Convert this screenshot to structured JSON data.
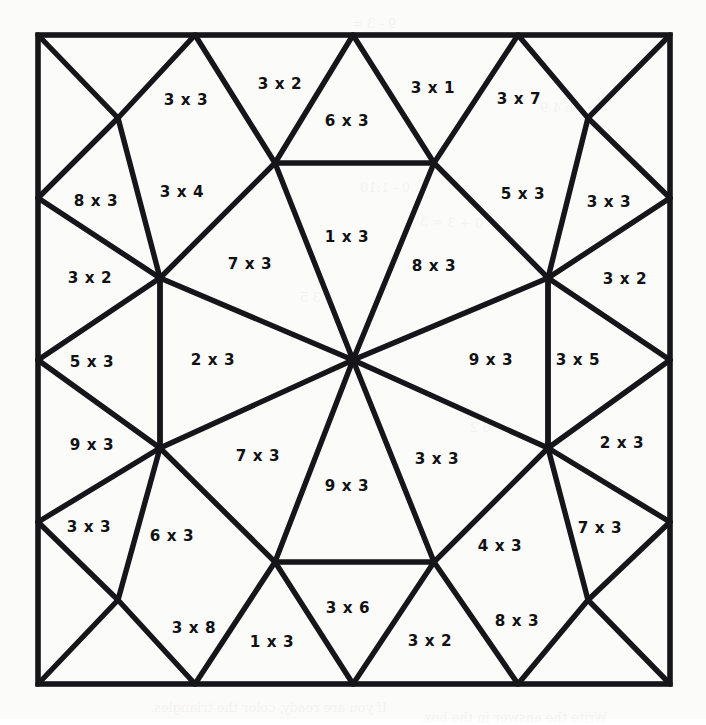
{
  "page": {
    "type": "math-coloring-worksheet",
    "background_color": "#fbfbfa",
    "line_color": "#16161a",
    "text_color": "#111114",
    "width": 706,
    "height": 719
  },
  "frame": {
    "left": 38,
    "top": 35,
    "right": 670,
    "bottom": 684
  },
  "geometry": {
    "outer_corners": [
      [
        38,
        35
      ],
      [
        670,
        35
      ],
      [
        670,
        684
      ],
      [
        38,
        684
      ]
    ],
    "edge_points": {
      "top": [
        [
          195,
          35
        ],
        [
          353,
          35
        ],
        [
          518,
          35
        ]
      ],
      "bottom": [
        [
          195,
          684
        ],
        [
          353,
          684
        ],
        [
          518,
          684
        ]
      ],
      "left": [
        [
          38,
          198
        ],
        [
          38,
          360
        ],
        [
          38,
          522
        ]
      ],
      "right": [
        [
          670,
          198
        ],
        [
          670,
          360
        ],
        [
          670,
          522
        ]
      ]
    },
    "corner_vertices": [
      [
        118,
        118
      ],
      [
        588,
        118
      ],
      [
        588,
        600
      ],
      [
        118,
        600
      ]
    ],
    "ring_vertices": [
      [
        275,
        163
      ],
      [
        434,
        163
      ],
      [
        548,
        278
      ],
      [
        548,
        448
      ],
      [
        434,
        562
      ],
      [
        275,
        562
      ],
      [
        160,
        448
      ],
      [
        160,
        278
      ]
    ],
    "center": [
      353,
      360
    ],
    "segments": [
      [
        [
          38,
          35
        ],
        [
          118,
          118
        ]
      ],
      [
        [
          118,
          118
        ],
        [
          195,
          35
        ]
      ],
      [
        [
          195,
          35
        ],
        [
          275,
          163
        ]
      ],
      [
        [
          275,
          163
        ],
        [
          353,
          35
        ]
      ],
      [
        [
          353,
          35
        ],
        [
          434,
          163
        ]
      ],
      [
        [
          434,
          163
        ],
        [
          518,
          35
        ]
      ],
      [
        [
          518,
          35
        ],
        [
          588,
          118
        ]
      ],
      [
        [
          588,
          118
        ],
        [
          670,
          35
        ]
      ],
      [
        [
          670,
          198
        ],
        [
          588,
          118
        ]
      ],
      [
        [
          588,
          118
        ],
        [
          548,
          278
        ]
      ],
      [
        [
          548,
          278
        ],
        [
          670,
          198
        ]
      ],
      [
        [
          670,
          360
        ],
        [
          548,
          278
        ]
      ],
      [
        [
          548,
          278
        ],
        [
          548,
          448
        ]
      ],
      [
        [
          548,
          448
        ],
        [
          670,
          360
        ]
      ],
      [
        [
          670,
          522
        ],
        [
          548,
          448
        ]
      ],
      [
        [
          548,
          448
        ],
        [
          588,
          600
        ]
      ],
      [
        [
          588,
          600
        ],
        [
          670,
          522
        ]
      ],
      [
        [
          670,
          684
        ],
        [
          588,
          600
        ]
      ],
      [
        [
          588,
          600
        ],
        [
          518,
          684
        ]
      ],
      [
        [
          518,
          684
        ],
        [
          434,
          562
        ]
      ],
      [
        [
          434,
          562
        ],
        [
          353,
          684
        ]
      ],
      [
        [
          353,
          684
        ],
        [
          275,
          562
        ]
      ],
      [
        [
          275,
          562
        ],
        [
          195,
          684
        ]
      ],
      [
        [
          195,
          684
        ],
        [
          118,
          600
        ]
      ],
      [
        [
          118,
          600
        ],
        [
          38,
          684
        ]
      ],
      [
        [
          38,
          522
        ],
        [
          118,
          600
        ]
      ],
      [
        [
          118,
          600
        ],
        [
          160,
          448
        ]
      ],
      [
        [
          160,
          448
        ],
        [
          38,
          522
        ]
      ],
      [
        [
          38,
          360
        ],
        [
          160,
          448
        ]
      ],
      [
        [
          160,
          448
        ],
        [
          160,
          278
        ]
      ],
      [
        [
          160,
          278
        ],
        [
          38,
          360
        ]
      ],
      [
        [
          38,
          198
        ],
        [
          160,
          278
        ]
      ],
      [
        [
          160,
          278
        ],
        [
          118,
          118
        ]
      ],
      [
        [
          118,
          118
        ],
        [
          38,
          198
        ]
      ],
      [
        [
          160,
          278
        ],
        [
          275,
          163
        ]
      ],
      [
        [
          275,
          163
        ],
        [
          434,
          163
        ]
      ],
      [
        [
          434,
          163
        ],
        [
          548,
          278
        ]
      ],
      [
        [
          548,
          278
        ],
        [
          548,
          448
        ]
      ],
      [
        [
          548,
          448
        ],
        [
          434,
          562
        ]
      ],
      [
        [
          434,
          562
        ],
        [
          275,
          562
        ]
      ],
      [
        [
          275,
          562
        ],
        [
          160,
          448
        ]
      ],
      [
        [
          160,
          448
        ],
        [
          160,
          278
        ]
      ],
      [
        [
          353,
          360
        ],
        [
          275,
          163
        ]
      ],
      [
        [
          353,
          360
        ],
        [
          434,
          163
        ]
      ],
      [
        [
          353,
          360
        ],
        [
          548,
          278
        ]
      ],
      [
        [
          353,
          360
        ],
        [
          548,
          448
        ]
      ],
      [
        [
          353,
          360
        ],
        [
          434,
          562
        ]
      ],
      [
        [
          353,
          360
        ],
        [
          275,
          562
        ]
      ],
      [
        [
          353,
          360
        ],
        [
          160,
          448
        ]
      ],
      [
        [
          353,
          360
        ],
        [
          160,
          278
        ]
      ]
    ]
  },
  "cells": [
    {
      "id": "c01",
      "label": "3 x 3",
      "x": 186,
      "y": 100
    },
    {
      "id": "c02",
      "label": "3 x 2",
      "x": 280,
      "y": 84
    },
    {
      "id": "c03",
      "label": "6 x 3",
      "x": 347,
      "y": 121
    },
    {
      "id": "c04",
      "label": "3 x 1",
      "x": 433,
      "y": 88
    },
    {
      "id": "c05",
      "label": "3 x 7",
      "x": 519,
      "y": 99
    },
    {
      "id": "c06",
      "label": "8 x 3",
      "x": 96,
      "y": 201
    },
    {
      "id": "c07",
      "label": "3 x 4",
      "x": 182,
      "y": 192
    },
    {
      "id": "c08",
      "label": "5 x 3",
      "x": 523,
      "y": 194
    },
    {
      "id": "c09",
      "label": "3 x 3",
      "x": 609,
      "y": 202
    },
    {
      "id": "c10",
      "label": "3 x 2",
      "x": 90,
      "y": 278
    },
    {
      "id": "c11",
      "label": "7 x 3",
      "x": 250,
      "y": 264
    },
    {
      "id": "c12",
      "label": "1 x 3",
      "x": 347,
      "y": 237
    },
    {
      "id": "c13",
      "label": "8 x 3",
      "x": 434,
      "y": 266
    },
    {
      "id": "c14",
      "label": "3 x 2",
      "x": 625,
      "y": 279
    },
    {
      "id": "c15",
      "label": "5 x 3",
      "x": 92,
      "y": 362
    },
    {
      "id": "c16",
      "label": "2 x 3",
      "x": 213,
      "y": 360
    },
    {
      "id": "c17",
      "label": "9 x 3",
      "x": 491,
      "y": 360
    },
    {
      "id": "c18",
      "label": "3 x 5",
      "x": 578,
      "y": 360
    },
    {
      "id": "c19",
      "label": "9 x 3",
      "x": 92,
      "y": 445
    },
    {
      "id": "c20",
      "label": "7 x 3",
      "x": 258,
      "y": 456
    },
    {
      "id": "c21",
      "label": "3 x 3",
      "x": 437,
      "y": 459
    },
    {
      "id": "c22",
      "label": "2 x 3",
      "x": 622,
      "y": 443
    },
    {
      "id": "c23",
      "label": "9 x 3",
      "x": 347,
      "y": 486
    },
    {
      "id": "c24",
      "label": "3 x 3",
      "x": 89,
      "y": 527
    },
    {
      "id": "c25",
      "label": "6 x 3",
      "x": 172,
      "y": 536
    },
    {
      "id": "c26",
      "label": "4 x 3",
      "x": 500,
      "y": 546
    },
    {
      "id": "c27",
      "label": "7 x 3",
      "x": 600,
      "y": 528
    },
    {
      "id": "c28",
      "label": "3 x 8",
      "x": 194,
      "y": 628
    },
    {
      "id": "c29",
      "label": "1 x 3",
      "x": 272,
      "y": 642
    },
    {
      "id": "c30",
      "label": "3 x 6",
      "x": 348,
      "y": 608
    },
    {
      "id": "c31",
      "label": "3 x 2",
      "x": 430,
      "y": 641
    },
    {
      "id": "c32",
      "label": "8 x 3",
      "x": 517,
      "y": 621
    }
  ],
  "bleed_marks": [
    {
      "text": "9 - 3 =",
      "x": 352,
      "y": 16,
      "rot": 0
    },
    {
      "text": "0 - 1:10",
      "x": 360,
      "y": 180,
      "rot": 0
    },
    {
      "text": "6 4 9",
      "x": 540,
      "y": 100,
      "rot": 0
    },
    {
      "text": "0 + 3 = 3",
      "x": 420,
      "y": 215,
      "rot": -2
    },
    {
      "text": "2 3 5",
      "x": 300,
      "y": 290,
      "rot": 0
    },
    {
      "text": "3 6 2",
      "x": 470,
      "y": 420,
      "rot": 0
    },
    {
      "text": "If you are ready, color the triangles.",
      "x": 150,
      "y": 700,
      "rot": 0
    },
    {
      "text": "Write the answer in the box.",
      "x": 420,
      "y": 710,
      "rot": 0
    }
  ]
}
